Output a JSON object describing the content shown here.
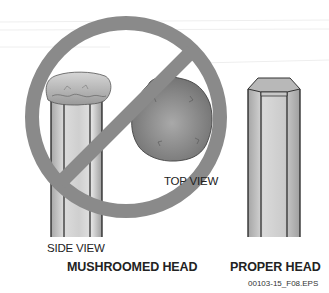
{
  "figure": {
    "labels": {
      "top_view": "TOP VIEW",
      "side_view": "SIDE VIEW",
      "mushroomed_head": "MUSHROOMED HEAD",
      "proper_head": "PROPER HEAD",
      "file_id": "00103-15_F08.EPS"
    },
    "prohibition_symbol": {
      "meaning": "not allowed",
      "color": "#8a8a8a"
    },
    "colors": {
      "tool_fill": "#c9c9c9",
      "tool_dark": "#9a9a9a",
      "tool_outline": "#222222",
      "top_view_fill": "#909090"
    }
  }
}
